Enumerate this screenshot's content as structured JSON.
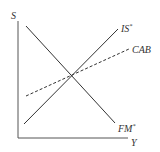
{
  "diagram": {
    "type": "economic-model",
    "axes": {
      "y_label": "S",
      "x_label": "Y"
    },
    "curves": [
      {
        "name": "IS*",
        "label": "IS*",
        "style": "solid",
        "slope": "upward"
      },
      {
        "name": "FM*",
        "label": "FM*",
        "style": "solid",
        "slope": "downward"
      },
      {
        "name": "CAB",
        "label": "CAB",
        "style": "dashed",
        "slope": "upward (flatter)"
      }
    ],
    "colors": {
      "line": "#333333",
      "background": "#ffffff"
    }
  },
  "labels": {
    "y_axis": "S",
    "x_axis": "Y",
    "is_curve_base": "IS",
    "is_curve_sup": "*",
    "fm_curve_base": "FM",
    "fm_curve_sup": "*",
    "cab_curve": "CAB"
  }
}
